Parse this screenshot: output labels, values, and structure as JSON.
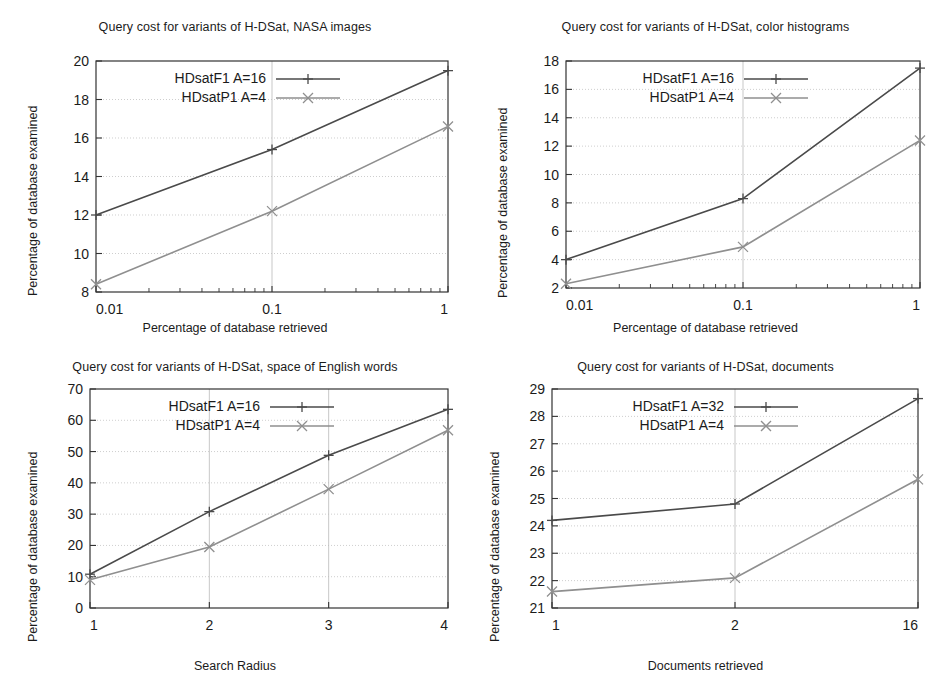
{
  "figure": {
    "background": "#ffffff",
    "series_colors": {
      "f1": "#4a4a4a",
      "p1": "#8f8f8f"
    },
    "axis_color": "#333333",
    "grid_color": "#b9b9b9"
  },
  "panels": [
    {
      "id": "nasa-images",
      "title": "Query cost for variants of H-DSat, NASA images",
      "ylabel": "Percentage of database examined",
      "xlabel": "Percentage of database retrieved",
      "legend": [
        {
          "label": "HDsatF1 A=16",
          "marker": "plus-marker"
        },
        {
          "label": "HDsatP1 A=4",
          "marker": "cross-marker"
        }
      ],
      "xticks": [
        "0.01",
        "0.1",
        "1"
      ],
      "yticks": [
        "8",
        "10",
        "12",
        "14",
        "16",
        "18",
        "20"
      ],
      "chart_data": {
        "type": "line",
        "title": "Query cost for variants of H-DSat, NASA images",
        "xlabel": "Percentage of database retrieved",
        "ylabel": "Percentage of database examined",
        "xscale": "log",
        "x": [
          0.01,
          0.1,
          1
        ],
        "xticklabels": [
          "0.01",
          "0.1",
          "1"
        ],
        "yticks": [
          8,
          10,
          12,
          14,
          16,
          18,
          20
        ],
        "ylim": [
          8,
          20
        ],
        "xlim": [
          0.01,
          1
        ],
        "grid": true,
        "legend_position": "upper-left",
        "series": [
          {
            "name": "HDsatF1 A=16",
            "values": [
              12.0,
              15.4,
              19.5
            ]
          },
          {
            "name": "HDsatP1 A=4",
            "values": [
              8.4,
              12.2,
              16.6
            ]
          }
        ]
      }
    },
    {
      "id": "color-histograms",
      "title": "Query cost for variants of H-DSat, color histograms",
      "ylabel": "Percentage of database examined",
      "xlabel": "Percentage of database retrieved",
      "legend": [
        {
          "label": "HDsatF1 A=16",
          "marker": "plus-marker"
        },
        {
          "label": "HDsatP1 A=4",
          "marker": "cross-marker"
        }
      ],
      "xticks": [
        "0.01",
        "0.1",
        "1"
      ],
      "yticks": [
        "2",
        "4",
        "6",
        "8",
        "10",
        "12",
        "14",
        "16",
        "18"
      ],
      "chart_data": {
        "type": "line",
        "title": "Query cost for variants of H-DSat, color histograms",
        "xlabel": "Percentage of database retrieved",
        "ylabel": "Percentage of database examined",
        "xscale": "log",
        "x": [
          0.01,
          0.1,
          1
        ],
        "xticklabels": [
          "0.01",
          "0.1",
          "1"
        ],
        "yticks": [
          2,
          4,
          6,
          8,
          10,
          12,
          14,
          16,
          18
        ],
        "ylim": [
          2,
          18
        ],
        "xlim": [
          0.01,
          1
        ],
        "grid": true,
        "legend_position": "upper-left",
        "series": [
          {
            "name": "HDsatF1 A=16",
            "values": [
              4.0,
              8.3,
              17.5
            ]
          },
          {
            "name": "HDsatP1 A=4",
            "values": [
              2.3,
              4.9,
              12.4
            ]
          }
        ]
      }
    },
    {
      "id": "english-words",
      "title": "Query cost for variants of H-DSat, space of English words",
      "ylabel": "Percentage of database examined",
      "xlabel": "Search Radius",
      "legend": [
        {
          "label": "HDsatF1 A=16",
          "marker": "plus-marker"
        },
        {
          "label": "HDsatP1 A=4",
          "marker": "cross-marker"
        }
      ],
      "xticks": [
        "1",
        "2",
        "3",
        "4"
      ],
      "yticks": [
        "0",
        "10",
        "20",
        "30",
        "40",
        "50",
        "60",
        "70"
      ],
      "chart_data": {
        "type": "line",
        "title": "Query cost for variants of H-DSat, space of English words",
        "xlabel": "Search Radius",
        "ylabel": "Percentage of database examined",
        "xscale": "linear",
        "x": [
          1,
          2,
          3,
          4
        ],
        "xticklabels": [
          "1",
          "2",
          "3",
          "4"
        ],
        "yticks": [
          0,
          10,
          20,
          30,
          40,
          50,
          60,
          70
        ],
        "ylim": [
          0,
          70
        ],
        "xlim": [
          1,
          4
        ],
        "grid": true,
        "legend_position": "upper-left",
        "series": [
          {
            "name": "HDsatF1 A=16",
            "values": [
              10.8,
              30.8,
              48.8,
              63.5
            ]
          },
          {
            "name": "HDsatP1 A=4",
            "values": [
              9.0,
              19.5,
              38.0,
              56.8
            ]
          }
        ]
      }
    },
    {
      "id": "documents",
      "title": "Query cost for variants of H-DSat, documents",
      "ylabel": "Percentage of database examined",
      "xlabel": "Documents retrieved",
      "legend": [
        {
          "label": "HDsatF1 A=32",
          "marker": "plus-marker"
        },
        {
          "label": "HDsatP1 A=4",
          "marker": "cross-marker"
        }
      ],
      "xticks": [
        "1",
        "2",
        "16"
      ],
      "yticks": [
        "21",
        "22",
        "23",
        "24",
        "25",
        "26",
        "27",
        "28",
        "29"
      ],
      "chart_data": {
        "type": "line",
        "title": "Query cost for variants of H-DSat, documents",
        "xlabel": "Documents retrieved",
        "ylabel": "Percentage of database examined",
        "xscale": "categorical",
        "x": [
          1,
          2,
          16
        ],
        "xticklabels": [
          "1",
          "2",
          "16"
        ],
        "yticks": [
          21,
          22,
          23,
          24,
          25,
          26,
          27,
          28,
          29
        ],
        "ylim": [
          21,
          29
        ],
        "grid": true,
        "legend_position": "upper-left",
        "series": [
          {
            "name": "HDsatF1 A=32",
            "values": [
              24.2,
              24.8,
              28.65
            ]
          },
          {
            "name": "HDsatP1 A=4",
            "values": [
              21.6,
              22.1,
              25.7
            ]
          }
        ]
      }
    }
  ]
}
